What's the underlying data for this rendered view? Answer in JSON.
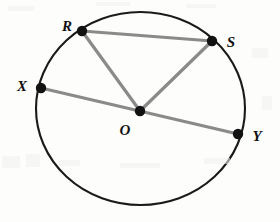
{
  "figure": {
    "type": "geometry-diagram",
    "background_color": "#fdfdfc",
    "width": 280,
    "height": 222
  },
  "circle": {
    "name": "circle-O",
    "center_x": 140.5,
    "center_y": 108.5,
    "radius_x": 104.5,
    "radius_y": 96.5,
    "stroke_color": "#1a1a1a",
    "stroke_width": 2.1,
    "fill": "none"
  },
  "style": {
    "chord_color": "#8a8a8a",
    "chord_width": 3.2,
    "point_color": "#121212",
    "point_radius": 5.2,
    "label_color": "#111111"
  },
  "points": [
    {
      "id": "R",
      "label": "R",
      "x": 82,
      "y": 31,
      "label_x": 67,
      "label_y": 26
    },
    {
      "id": "S",
      "label": "S",
      "x": 212,
      "y": 41,
      "label_x": 231,
      "label_y": 42
    },
    {
      "id": "X",
      "label": "X",
      "x": 41,
      "y": 88,
      "label_x": 22,
      "label_y": 86
    },
    {
      "id": "Y",
      "label": "Y",
      "x": 238,
      "y": 134,
      "label_x": 257,
      "label_y": 136
    },
    {
      "id": "O",
      "label": "O",
      "x": 140,
      "y": 111,
      "label_x": 125,
      "label_y": 130
    }
  ],
  "segments": [
    {
      "id": "RS",
      "name": "chord-R-S",
      "x1": 82,
      "y1": 31,
      "x2": 212,
      "y2": 41
    },
    {
      "id": "RO",
      "name": "radius-R-O",
      "x1": 82,
      "y1": 31,
      "x2": 140,
      "y2": 111
    },
    {
      "id": "OS",
      "name": "radius-O-S",
      "x1": 140,
      "y1": 111,
      "x2": 212,
      "y2": 41
    },
    {
      "id": "XY",
      "name": "diameter-X-Y",
      "x1": 41,
      "y1": 88,
      "x2": 238,
      "y2": 134
    }
  ],
  "artifacts": [
    {
      "x": 8,
      "y": 6,
      "w": 26,
      "h": 5
    },
    {
      "x": 96,
      "y": 2,
      "w": 34,
      "h": 4
    },
    {
      "x": 186,
      "y": 4,
      "w": 30,
      "h": 4
    },
    {
      "x": 2,
      "y": 156,
      "w": 18,
      "h": 12
    },
    {
      "x": 26,
      "y": 154,
      "w": 14,
      "h": 13
    },
    {
      "x": 58,
      "y": 160,
      "w": 22,
      "h": 6
    },
    {
      "x": 120,
      "y": 163,
      "w": 40,
      "h": 5
    },
    {
      "x": 204,
      "y": 158,
      "w": 26,
      "h": 6
    },
    {
      "x": 252,
      "y": 48,
      "w": 16,
      "h": 10
    },
    {
      "x": 262,
      "y": 96,
      "w": 10,
      "h": 14
    }
  ]
}
